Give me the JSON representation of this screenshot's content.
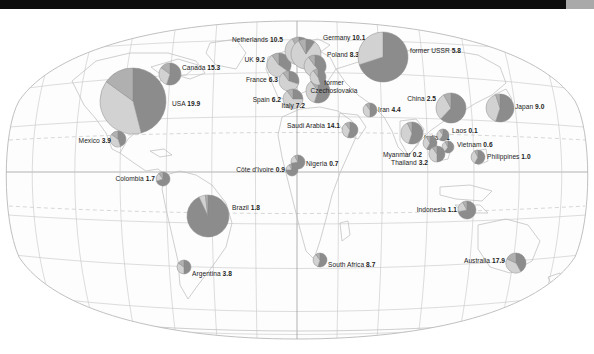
{
  "chart_data": {
    "type": "pie",
    "xlabel": "",
    "ylabel": "",
    "projection": "Robinson",
    "grid": true,
    "legend_position": "none",
    "value_note": "Bold number after each country name is the plotted value",
    "slice_colors": [
      "#8c8c8c",
      "#d2d2d2",
      "#b0b0b0"
    ],
    "categories": [
      "USA",
      "Canada",
      "Mexico",
      "Colombia",
      "Brazil",
      "Argentina",
      "UK",
      "Netherlands",
      "Germany",
      "France",
      "Spain",
      "Italy",
      "Poland",
      "former Czechoslovakia",
      "former USSR",
      "Saudi Arabia",
      "Iran",
      "Côte d'Ivoire",
      "Nigeria",
      "South Africa",
      "China",
      "India",
      "Japan",
      "Laos",
      "Vietnam",
      "Myanmar",
      "Thailand",
      "Philippines",
      "Indonesia",
      "Australia"
    ],
    "values": [
      19.9,
      15.3,
      3.9,
      1.7,
      1.8,
      3.8,
      9.2,
      10.5,
      10.1,
      6.3,
      6.2,
      7.2,
      8.3,
      null,
      5.8,
      14.1,
      4.4,
      0.9,
      0.7,
      8.7,
      2.5,
      1.1,
      9.0,
      0.1,
      0.6,
      0.2,
      3.2,
      1.0,
      1.1,
      17.9
    ],
    "points": [
      {
        "name": "USA",
        "value": "19.9",
        "cx": 133,
        "cy": 92,
        "r": 33,
        "slices": [
          46,
          39,
          15
        ],
        "label_side": "l",
        "lx": 172,
        "ly": 95
      },
      {
        "name": "Canada",
        "value": "15.3",
        "cx": 170,
        "cy": 65,
        "r": 11,
        "slices": [
          55,
          30,
          15
        ],
        "label_side": "l",
        "lx": 182,
        "ly": 59
      },
      {
        "name": "Mexico",
        "value": "3.9",
        "cx": 118,
        "cy": 130,
        "r": 8,
        "slices": [
          45,
          40,
          15
        ],
        "label_side": "r",
        "lx": 111,
        "ly": 132
      },
      {
        "name": "Colombia",
        "value": "1.7",
        "cx": 163,
        "cy": 170,
        "r": 7,
        "slices": [
          70,
          20,
          10
        ],
        "label_side": "r",
        "lx": 155,
        "ly": 170
      },
      {
        "name": "Brazil",
        "value": "1.8",
        "cx": 208,
        "cy": 207,
        "r": 21,
        "slices": [
          93,
          5,
          2
        ],
        "label_side": "l",
        "lx": 232,
        "ly": 199
      },
      {
        "name": "Argentina",
        "value": "3.8",
        "cx": 184,
        "cy": 258,
        "r": 7,
        "slices": [
          50,
          35,
          15
        ],
        "label_side": "l",
        "lx": 192,
        "ly": 265
      },
      {
        "name": "UK",
        "value": "9.2",
        "cx": 279,
        "cy": 56,
        "r": 12,
        "slices": [
          35,
          55,
          10
        ],
        "label_side": "r",
        "lx": 265,
        "ly": 51
      },
      {
        "name": "Netherlands",
        "value": "10.5",
        "cx": 299,
        "cy": 42,
        "r": 14,
        "slices": [
          12,
          80,
          8
        ],
        "label_side": "r",
        "lx": 283,
        "ly": 31
      },
      {
        "name": "Germany",
        "value": "10.1",
        "cx": 306,
        "cy": 45,
        "r": 15,
        "slices": [
          10,
          82,
          8
        ],
        "label_side": "l",
        "lx": 323,
        "ly": 29
      },
      {
        "name": "France",
        "value": "6.3",
        "cx": 289,
        "cy": 72,
        "r": 10,
        "slices": [
          30,
          60,
          10
        ],
        "label_side": "r",
        "lx": 278,
        "ly": 71
      },
      {
        "name": "Spain",
        "value": "6.2",
        "cx": 293,
        "cy": 90,
        "r": 10,
        "slices": [
          25,
          65,
          10
        ],
        "label_side": "r",
        "lx": 281,
        "ly": 91
      },
      {
        "name": "Italy",
        "value": "7.2",
        "cx": 318,
        "cy": 82,
        "r": 12,
        "slices": [
          55,
          35,
          10
        ],
        "label_side": "r",
        "lx": 305,
        "ly": 97
      },
      {
        "name": "Poland",
        "value": "8.3",
        "cx": 315,
        "cy": 57,
        "r": 11,
        "slices": [
          40,
          50,
          10
        ],
        "label_side": "l",
        "lx": 327,
        "ly": 46
      },
      {
        "name": "former Czechoslovakia",
        "value": "",
        "cx": 318,
        "cy": 68,
        "r": 8,
        "slices": [
          45,
          45,
          10
        ],
        "label_side": "two",
        "lx": 334,
        "ly": 78
      },
      {
        "name": "former USSR",
        "value": "5.8",
        "cx": 383,
        "cy": 48,
        "r": 25,
        "slices": [
          70,
          30,
          0
        ],
        "label_side": "l",
        "lx": 410,
        "ly": 42
      },
      {
        "name": "Saudi Arabia",
        "value": "14.1",
        "cx": 350,
        "cy": 121,
        "r": 8,
        "slices": [
          55,
          35,
          10
        ],
        "label_side": "r",
        "lx": 340,
        "ly": 117
      },
      {
        "name": "Iran",
        "value": "4.4",
        "cx": 370,
        "cy": 101,
        "r": 7,
        "slices": [
          50,
          40,
          10
        ],
        "label_side": "l",
        "lx": 378,
        "ly": 101
      },
      {
        "name": "Côte d'Ivoire",
        "value": "0.9",
        "cx": 292,
        "cy": 161,
        "r": 6,
        "slices": [
          75,
          18,
          7
        ],
        "label_side": "r",
        "lx": 285,
        "ly": 161
      },
      {
        "name": "Nigeria",
        "value": "0.7",
        "cx": 298,
        "cy": 153,
        "r": 7,
        "slices": [
          72,
          20,
          8
        ],
        "label_side": "l",
        "lx": 306,
        "ly": 155
      },
      {
        "name": "South Africa",
        "value": "8.7",
        "cx": 320,
        "cy": 251,
        "r": 7,
        "slices": [
          55,
          35,
          10
        ],
        "label_side": "l",
        "lx": 328,
        "ly": 256
      },
      {
        "name": "China",
        "value": "2.5",
        "cx": 451,
        "cy": 99,
        "r": 15,
        "slices": [
          62,
          30,
          8
        ],
        "label_side": "r",
        "lx": 436,
        "ly": 90
      },
      {
        "name": "India",
        "value": "1.1",
        "cx": 412,
        "cy": 124,
        "r": 11,
        "slices": [
          55,
          38,
          7
        ],
        "label_side": "l",
        "lx": 424,
        "ly": 129
      },
      {
        "name": "Japan",
        "value": "9.0",
        "cx": 500,
        "cy": 99,
        "r": 14,
        "slices": [
          55,
          40,
          5
        ],
        "label_side": "l",
        "lx": 515,
        "ly": 98
      },
      {
        "name": "Laos",
        "value": "0.1",
        "cx": 443,
        "cy": 126,
        "r": 6,
        "slices": [
          60,
          30,
          10
        ],
        "label_side": "l",
        "lx": 452,
        "ly": 122
      },
      {
        "name": "Vietnam",
        "value": "0.6",
        "cx": 448,
        "cy": 138,
        "r": 6,
        "slices": [
          60,
          32,
          8
        ],
        "label_side": "l",
        "lx": 457,
        "ly": 136
      },
      {
        "name": "Myanmar",
        "value": "0.2",
        "cx": 430,
        "cy": 134,
        "r": 7,
        "slices": [
          58,
          34,
          8
        ],
        "label_side": "r",
        "lx": 422,
        "ly": 146
      },
      {
        "name": "Thailand",
        "value": "3.2",
        "cx": 437,
        "cy": 145,
        "r": 8,
        "slices": [
          50,
          40,
          10
        ],
        "label_side": "r",
        "lx": 428,
        "ly": 154
      },
      {
        "name": "Philippines",
        "value": "1.0",
        "cx": 478,
        "cy": 148,
        "r": 7,
        "slices": [
          58,
          34,
          8
        ],
        "label_side": "l",
        "lx": 487,
        "ly": 148
      },
      {
        "name": "Indonesia",
        "value": "1.1",
        "cx": 467,
        "cy": 201,
        "r": 9,
        "slices": [
          72,
          20,
          8
        ],
        "label_side": "r",
        "lx": 457,
        "ly": 201
      },
      {
        "name": "Australia",
        "value": "17.9",
        "cx": 516,
        "cy": 254,
        "r": 10,
        "slices": [
          42,
          40,
          18
        ],
        "label_side": "r",
        "lx": 505,
        "ly": 252
      }
    ]
  }
}
